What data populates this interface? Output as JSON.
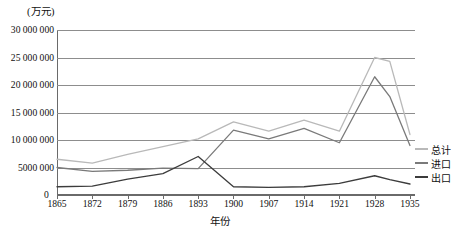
{
  "chart_data": {
    "type": "line",
    "title": "",
    "xlabel": "年份",
    "ylabel": "(万元)",
    "y_unit_caption": "(万元)",
    "grid": "horizontal",
    "legend_position": "right",
    "xlim": [
      1865,
      1936
    ],
    "ylim": [
      0,
      30000000
    ],
    "y_ticks": [
      0,
      5000000,
      10000000,
      15000000,
      20000000,
      25000000,
      30000000
    ],
    "y_tick_labels": [
      "0",
      "5000 000",
      "10 000 000",
      "15 000 000",
      "20 000 000",
      "25 000 000",
      "30 000 000"
    ],
    "x_ticks": [
      1865,
      1872,
      1879,
      1886,
      1893,
      1900,
      1907,
      1914,
      1921,
      1928,
      1935
    ],
    "x_tick_labels": [
      "1865",
      "1872",
      "1879",
      "1886",
      "1893",
      "1900",
      "1907",
      "1914",
      "1921",
      "1928",
      "1935"
    ],
    "x": [
      1865,
      1872,
      1879,
      1886,
      1893,
      1900,
      1907,
      1914,
      1921,
      1928,
      1931,
      1935
    ],
    "series": [
      {
        "name": "总计",
        "color": "#b9b9b9",
        "values": [
          6500000,
          5800000,
          7400000,
          8800000,
          10200000,
          13300000,
          11600000,
          13600000,
          11600000,
          25000000,
          24300000,
          11000000
        ]
      },
      {
        "name": "进口",
        "color": "#7a7a7a",
        "values": [
          5000000,
          4300000,
          4500000,
          4900000,
          4800000,
          11800000,
          10200000,
          12100000,
          9500000,
          21500000,
          17900000,
          9000000
        ]
      },
      {
        "name": "出口",
        "color": "#3c3c3c",
        "values": [
          1500000,
          1600000,
          2900000,
          3900000,
          7000000,
          1500000,
          1400000,
          1500000,
          2100000,
          3500000,
          2800000,
          2000000
        ]
      }
    ]
  },
  "legend": {
    "items": [
      {
        "label": "总计",
        "color": "#b9b9b9"
      },
      {
        "label": "进口",
        "color": "#7a7a7a"
      },
      {
        "label": "出口",
        "color": "#3c3c3c"
      }
    ]
  },
  "axes": {
    "y_unit": "(万元)",
    "x_title": "年份",
    "zero_label": "0"
  }
}
